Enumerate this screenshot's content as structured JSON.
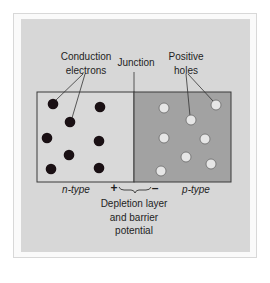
{
  "labels": {
    "conduction_electrons_line1": "Conduction",
    "conduction_electrons_line2": "electrons",
    "junction": "Junction",
    "positive_holes_line1": "Positive",
    "positive_holes_line2": "holes",
    "n_type": "n-type",
    "p_type": "p-type",
    "plus": "+",
    "minus": "–",
    "depletion_line1": "Depletion layer",
    "depletion_line2": "and barrier",
    "depletion_line3": "potential"
  },
  "colors": {
    "background": "#ffffff",
    "panel": "#d7d7d7",
    "n_region": "#d9d9d9",
    "p_region": "#a2a2a2",
    "electron": "#1a1014",
    "hole": "#e6e6e6",
    "stroke": "#3a3a3a"
  },
  "regions": {
    "n_type": {
      "x": 37,
      "y": 92,
      "width": 97,
      "height": 90
    },
    "p_type": {
      "x": 134,
      "y": 92,
      "width": 97,
      "height": 90
    }
  },
  "electrons": [
    {
      "cx": 53,
      "cy": 104
    },
    {
      "cx": 100,
      "cy": 107
    },
    {
      "cx": 70,
      "cy": 122
    },
    {
      "cx": 47,
      "cy": 138
    },
    {
      "cx": 99,
      "cy": 141
    },
    {
      "cx": 69,
      "cy": 155
    },
    {
      "cx": 51,
      "cy": 169
    },
    {
      "cx": 99,
      "cy": 168
    }
  ],
  "holes": [
    {
      "cx": 164,
      "cy": 108
    },
    {
      "cx": 216,
      "cy": 105
    },
    {
      "cx": 191,
      "cy": 120
    },
    {
      "cx": 164,
      "cy": 138
    },
    {
      "cx": 205,
      "cy": 139
    },
    {
      "cx": 186,
      "cy": 157
    },
    {
      "cx": 211,
      "cy": 164
    },
    {
      "cx": 161,
      "cy": 171
    }
  ]
}
